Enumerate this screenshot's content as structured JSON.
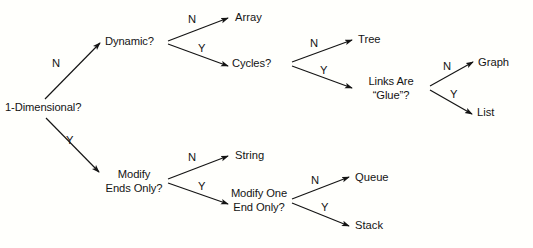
{
  "diagram": {
    "type": "decision-tree",
    "background_color": "#fffffc",
    "ink_color": "#141414",
    "decision_nodes": [
      {
        "id": "root",
        "text": "1-Dimensional?",
        "line1": "1-Dimensional?",
        "line2": ""
      },
      {
        "id": "dynamic",
        "text": "Dynamic?",
        "line1": "Dynamic?",
        "line2": ""
      },
      {
        "id": "cycles",
        "text": "Cycles?",
        "line1": "Cycles?",
        "line2": ""
      },
      {
        "id": "links-are-glue",
        "text": "Links Are “Glue”?",
        "line1": "Links Are",
        "line2": "“Glue”?"
      },
      {
        "id": "modify-ends",
        "text": "Modify Ends Only?",
        "line1": "Modify",
        "line2": "Ends Only?"
      },
      {
        "id": "modify-one-end",
        "text": "Modify One End Only?",
        "line1": "Modify One",
        "line2": "End Only?"
      }
    ],
    "leaf_nodes": [
      {
        "id": "array",
        "text": "Array"
      },
      {
        "id": "tree",
        "text": "Tree"
      },
      {
        "id": "graph",
        "text": "Graph"
      },
      {
        "id": "list",
        "text": "List"
      },
      {
        "id": "string",
        "text": "String"
      },
      {
        "id": "queue",
        "text": "Queue"
      },
      {
        "id": "stack",
        "text": "Stack"
      }
    ],
    "edges": [
      {
        "id": "root-no",
        "from": "root",
        "to": "dynamic",
        "label": "N"
      },
      {
        "id": "root-yes",
        "from": "root",
        "to": "modify-ends",
        "label": "Y"
      },
      {
        "id": "dynamic-no",
        "from": "dynamic",
        "to": "array",
        "label": "N"
      },
      {
        "id": "dynamic-yes",
        "from": "dynamic",
        "to": "cycles",
        "label": "Y"
      },
      {
        "id": "cycles-no",
        "from": "cycles",
        "to": "tree",
        "label": "N"
      },
      {
        "id": "cycles-yes",
        "from": "cycles",
        "to": "links-are-glue",
        "label": "Y"
      },
      {
        "id": "glue-no",
        "from": "links-are-glue",
        "to": "graph",
        "label": "N"
      },
      {
        "id": "glue-yes",
        "from": "links-are-glue",
        "to": "list",
        "label": "Y"
      },
      {
        "id": "modify-ends-no",
        "from": "modify-ends",
        "to": "string",
        "label": "N"
      },
      {
        "id": "modify-ends-yes",
        "from": "modify-ends",
        "to": "modify-one-end",
        "label": "Y"
      },
      {
        "id": "modify-one-end-no",
        "from": "modify-one-end",
        "to": "queue",
        "label": "N"
      },
      {
        "id": "modify-one-end-yes",
        "from": "modify-one-end",
        "to": "stack",
        "label": "Y"
      }
    ]
  }
}
